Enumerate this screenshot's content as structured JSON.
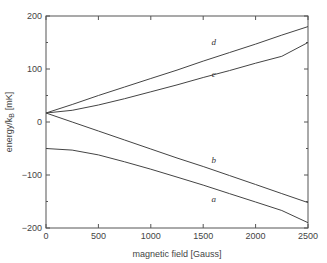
{
  "chart_data": {
    "type": "line",
    "title": "",
    "xlabel": "magnetic field [Gauss]",
    "ylabel": "energy/k_B [mK]",
    "ylabel_main": "energy/k",
    "ylabel_sub": "B",
    "ylabel_unit": "[mK]",
    "xlim": [
      0,
      2500
    ],
    "ylim": [
      -200,
      200
    ],
    "x_ticks": [
      0,
      500,
      1000,
      1500,
      2000,
      2500
    ],
    "y_ticks": [
      -200,
      -100,
      0,
      100,
      200
    ],
    "y_minor_ticks": [
      -150,
      -50,
      50,
      150
    ],
    "grid": false,
    "legend": "inline curve labels",
    "x": [
      0,
      250,
      500,
      750,
      1000,
      1250,
      1500,
      1750,
      2000,
      2250,
      2500
    ],
    "series": [
      {
        "name": "d",
        "values": [
          17,
          33,
          50,
          66,
          82,
          98,
          115,
          131,
          147,
          164,
          180
        ]
      },
      {
        "name": "c",
        "values": [
          17,
          22,
          32,
          44,
          57,
          70,
          84,
          97,
          111,
          124,
          150
        ]
      },
      {
        "name": "b",
        "values": [
          17,
          0,
          -17,
          -34,
          -51,
          -68,
          -84,
          -101,
          -118,
          -135,
          -152
        ]
      },
      {
        "name": "a",
        "values": [
          -50,
          -53,
          -62,
          -75,
          -89,
          -104,
          -119,
          -135,
          -151,
          -167,
          -190
        ]
      }
    ],
    "annotations": [
      {
        "text": "d",
        "x": 1600,
        "y": 145
      },
      {
        "text": "c",
        "x": 1600,
        "y": 85
      },
      {
        "text": "b",
        "x": 1600,
        "y": -78
      },
      {
        "text": "a",
        "x": 1600,
        "y": -150
      }
    ]
  }
}
